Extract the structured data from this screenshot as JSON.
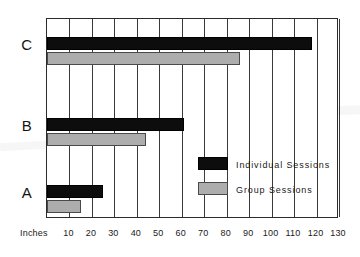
{
  "chart_data": {
    "type": "bar",
    "orientation": "horizontal",
    "title": "",
    "xlabel": "Inches",
    "ylabel": "",
    "categories": [
      "A",
      "B",
      "C"
    ],
    "series": [
      {
        "name": "Individual Sessions",
        "color": "#0d0d0d",
        "values": [
          25,
          61,
          118
        ]
      },
      {
        "name": "Group Sessions",
        "color": "#adadad",
        "values": [
          15,
          44,
          86
        ]
      }
    ],
    "xlim": [
      0,
      130
    ],
    "xticks": [
      10,
      20,
      30,
      40,
      50,
      60,
      70,
      80,
      90,
      100,
      110,
      120,
      130
    ],
    "xtick_labels": [
      "10",
      "20",
      "30",
      "40",
      "50",
      "60",
      "70",
      "80",
      "90",
      "100",
      "110",
      "120",
      "130"
    ],
    "grid": true,
    "grid_axis": "x",
    "legend_position": "inside-center-right",
    "legend": [
      {
        "label": "Individual Sessions",
        "swatch": "individual"
      },
      {
        "label": "Group Sessions",
        "swatch": "group"
      }
    ]
  },
  "axis": {
    "units_label": "Inches"
  },
  "colors": {
    "individual": "#0d0d0d",
    "group": "#adadad",
    "frame": "#2b2b2b",
    "grid": "#3a3a3a",
    "background": "#ffffff"
  }
}
